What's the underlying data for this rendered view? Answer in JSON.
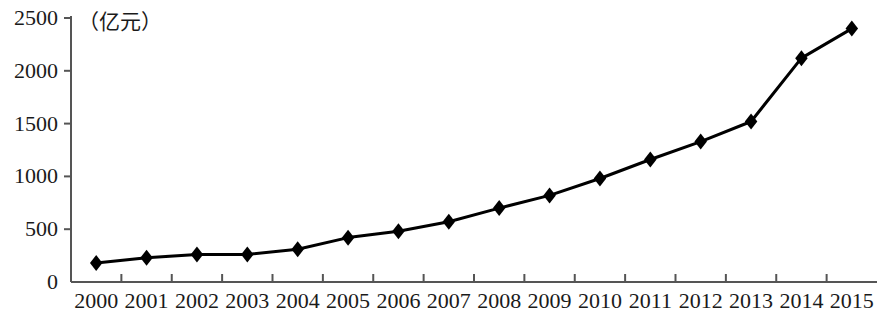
{
  "chart_data": {
    "type": "line",
    "title": "",
    "subtitle": "",
    "unit_label": "（亿元）",
    "xlabel": "",
    "ylabel": "",
    "categories": [
      "2000",
      "2001",
      "2002",
      "2003",
      "2004",
      "2005",
      "2006",
      "2007",
      "2008",
      "2009",
      "2010",
      "2011",
      "2012",
      "2013",
      "2014",
      "2015"
    ],
    "values": [
      180,
      230,
      260,
      260,
      310,
      420,
      480,
      570,
      700,
      820,
      980,
      1160,
      1330,
      1520,
      2120,
      2400
    ],
    "series": [
      {
        "name": "",
        "values": [
          180,
          230,
          260,
          260,
          310,
          420,
          480,
          570,
          700,
          820,
          980,
          1160,
          1330,
          1520,
          2120,
          2400
        ]
      }
    ],
    "ylim": [
      0,
      2500
    ],
    "y_ticks": [
      0,
      500,
      1000,
      1500,
      2000,
      2500
    ],
    "y_tick_labels": [
      "0",
      "500",
      "1000",
      "1500",
      "2000",
      "2500"
    ],
    "x_tick_labels": [
      "2000",
      "2001",
      "2002",
      "2003",
      "2004",
      "2005",
      "2006",
      "2007",
      "2008",
      "2009",
      "2010",
      "2011",
      "2012",
      "2013",
      "2014",
      "2015"
    ],
    "grid": false,
    "legend": null,
    "legend_position": "none",
    "marker": "diamond",
    "line_color": "#000000",
    "marker_color": "#000000",
    "axis_color": "#555555",
    "annotations": []
  },
  "axes": {
    "unit_text": "（亿元）",
    "y_labels": [
      "2500",
      "2000",
      "1500",
      "1000",
      "500",
      "0"
    ],
    "x_labels": [
      "2000",
      "2001",
      "2002",
      "2003",
      "2004",
      "2005",
      "2006",
      "2007",
      "2008",
      "2009",
      "2010",
      "2011",
      "2012",
      "2013",
      "2014",
      "2015"
    ]
  }
}
